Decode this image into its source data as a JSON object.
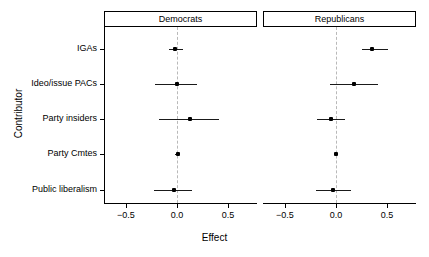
{
  "chart_data": {
    "type": "scatter",
    "title": "",
    "xlabel": "Effect",
    "ylabel": "Contributor",
    "categories": [
      "IGAs",
      "Ideo/issue PACs",
      "Party insiders",
      "Party Cmtes",
      "Public liberalism"
    ],
    "xticks": [
      -0.5,
      0.0,
      0.5
    ],
    "xticklabels": [
      "−0.5",
      "0.0",
      "0.5"
    ],
    "xlim": [
      -0.72,
      0.78
    ],
    "grid": false,
    "legend": null,
    "reference_line": {
      "value": 0.0,
      "style": "dashed",
      "color": "#b9b9b9"
    },
    "panels": [
      {
        "name": "Democrats",
        "points": [
          {
            "category": "IGAs",
            "estimate": -0.02,
            "low": -0.08,
            "high": 0.06
          },
          {
            "category": "Ideo/issue PACs",
            "estimate": 0.0,
            "low": -0.22,
            "high": 0.19
          },
          {
            "category": "Party insiders",
            "estimate": 0.12,
            "low": -0.18,
            "high": 0.41
          },
          {
            "category": "Party Cmtes",
            "estimate": 0.005,
            "low": -0.02,
            "high": 0.02
          },
          {
            "category": "Public liberalism",
            "estimate": -0.03,
            "low": -0.23,
            "high": 0.14
          }
        ]
      },
      {
        "name": "Republicans",
        "points": [
          {
            "category": "IGAs",
            "estimate": 0.35,
            "low": 0.25,
            "high": 0.5
          },
          {
            "category": "Ideo/issue PACs",
            "estimate": 0.17,
            "low": -0.06,
            "high": 0.41
          },
          {
            "category": "Party insiders",
            "estimate": -0.05,
            "low": -0.19,
            "high": 0.08
          },
          {
            "category": "Party Cmtes",
            "estimate": -0.005,
            "low": -0.02,
            "high": 0.02
          },
          {
            "category": "Public liberalism",
            "estimate": -0.03,
            "low": -0.2,
            "high": 0.14
          }
        ]
      }
    ],
    "colors": {
      "point": "#000000",
      "whisker": "#1a1a1a",
      "refline": "#b9b9b9",
      "axis": "#000000",
      "background": "#ffffff"
    }
  },
  "axes": {
    "x_title": "Effect",
    "y_title": "Contributor"
  },
  "strips": {
    "left": "Democrats",
    "right": "Republicans"
  }
}
